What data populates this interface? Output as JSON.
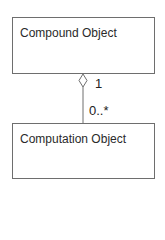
{
  "diagram": {
    "type": "uml-class-aggregation",
    "classes": [
      {
        "name": "Compound Object"
      },
      {
        "name": "Computation Object"
      }
    ],
    "association": {
      "kind": "aggregation",
      "whole_end_multiplicity": "1",
      "part_end_multiplicity": "0..*"
    },
    "colors": {
      "line": "#6e6e6e",
      "text": "#222222"
    }
  }
}
